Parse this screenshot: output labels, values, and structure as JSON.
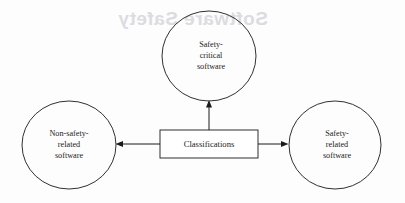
{
  "diagram": {
    "type": "node-link-diagram",
    "center": {
      "id": "classifications",
      "shape": "rectangle",
      "label": "Classifications",
      "x": 209,
      "y": 144,
      "width": 98,
      "height": 28
    },
    "nodes": [
      {
        "id": "safety-critical-software",
        "shape": "ellipse",
        "lines": [
          "Safety-",
          "critical",
          "software"
        ],
        "cx": 209,
        "cy": 56,
        "rx": 47,
        "ry": 45,
        "position": "top"
      },
      {
        "id": "non-safety-related-software",
        "shape": "ellipse",
        "lines": [
          "Non-safety-",
          "related",
          "software"
        ],
        "cx": 69,
        "cy": 145,
        "rx": 47,
        "ry": 44,
        "position": "left"
      },
      {
        "id": "safety-related-software",
        "shape": "ellipse",
        "lines": [
          "Safety-",
          "related",
          "software"
        ],
        "cx": 335,
        "cy": 145,
        "rx": 46,
        "ry": 44,
        "position": "right"
      }
    ],
    "edges": [
      {
        "id": "edge-to-safety-critical",
        "from": "classifications",
        "to": "safety-critical-software",
        "direction": "up",
        "arrow": "single"
      },
      {
        "id": "edge-to-non-safety-related",
        "from": "classifications",
        "to": "non-safety-related-software",
        "direction": "left",
        "arrow": "single"
      },
      {
        "id": "edge-to-safety-related",
        "from": "classifications",
        "to": "safety-related-software",
        "direction": "right",
        "arrow": "single"
      }
    ],
    "colors": {
      "stroke": "#1a1a1a",
      "text": "#1b1b1b",
      "background": "#fdfdfd",
      "bleed_through": "#dcdce0"
    }
  },
  "background_bleed": {
    "heading_fragment": "Software Safety",
    "note": "faint mirrored show-through from the reverse side of the scanned page"
  }
}
